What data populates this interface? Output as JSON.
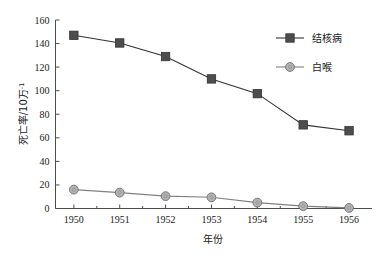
{
  "chart_data": {
    "type": "line",
    "title": "",
    "xlabel": "年份",
    "ylabel": "死亡率/10万",
    "ylabel_sup": "-1",
    "categories": [
      "1950",
      "1951",
      "1952",
      "1953",
      "1954",
      "1955",
      "1956"
    ],
    "x": [
      1950,
      1951,
      1952,
      1953,
      1954,
      1955,
      1956
    ],
    "xlim": [
      1949.6,
      1956.5
    ],
    "ylim": [
      0,
      160
    ],
    "yticks": [
      0,
      20,
      40,
      60,
      80,
      100,
      120,
      140,
      160
    ],
    "ytick_labels": [
      "0",
      "20",
      "40",
      "60",
      "80",
      "100",
      "120",
      "140",
      "160"
    ],
    "grid": false,
    "legend_position": "upper-right",
    "series": [
      {
        "name": "结核病",
        "marker": "square",
        "color": "#4d4d4d",
        "line_color": "#333333",
        "values": [
          147,
          140.5,
          129,
          110,
          97.5,
          71,
          66
        ]
      },
      {
        "name": "白喉",
        "marker": "circle",
        "color": "#b3b3b3",
        "line_color": "#808080",
        "values": [
          16,
          13.5,
          10.5,
          9.5,
          5,
          2,
          0.5
        ]
      }
    ]
  },
  "legend": {
    "items": [
      {
        "label": "结核病",
        "marker": "square",
        "color": "#4d4d4d"
      },
      {
        "label": "白喉",
        "marker": "circle",
        "color": "#b3b3b3"
      }
    ]
  },
  "axes": {
    "x_title": "年份",
    "y_title_main": "死亡率/10万",
    "y_title_sup": "-1"
  }
}
